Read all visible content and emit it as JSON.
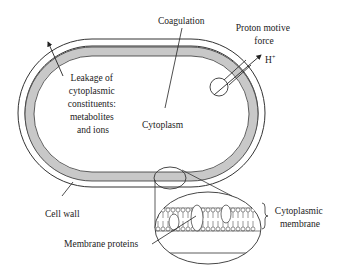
{
  "diagram": {
    "labels": {
      "coagulation": "Coagulation",
      "proton_motive_force_line1": "Proton motive",
      "proton_motive_force_line2": "force",
      "h_plus": "H",
      "h_plus_sup": "+",
      "leakage_line1": "Leakage of",
      "leakage_line2": "cytoplasmic",
      "leakage_line3": "constituents:",
      "leakage_line4": "metabolites",
      "leakage_line5": "and ions",
      "cytoplasm": "Cytoplasm",
      "cell_wall": "Cell wall",
      "membrane_proteins": "Membrane proteins",
      "cytoplasmic_membrane_line1": "Cytoplasmic",
      "cytoplasmic_membrane_line2": "membrane"
    },
    "colors": {
      "line": "#333333",
      "membrane_fill": "#c8c8c8",
      "background": "#ffffff"
    }
  }
}
